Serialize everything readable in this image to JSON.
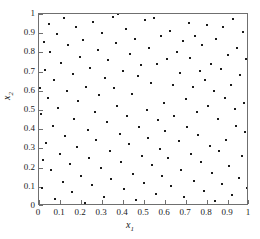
{
  "chart_data": {
    "type": "scatter",
    "title": "",
    "xlabel": "x1",
    "ylabel": "x2",
    "xlabel_base": "x",
    "xlabel_sub": "1",
    "ylabel_base": "x",
    "ylabel_sub": "2",
    "xlim": [
      0,
      1
    ],
    "ylim": [
      0,
      1
    ],
    "grid": false,
    "legend": null,
    "marker": "square-dot",
    "marker_color": "#1a1a1a",
    "marker_size_px": 2,
    "xticks": [
      0,
      0.1,
      0.2,
      0.3,
      0.4,
      0.5,
      0.6,
      0.7,
      0.8,
      0.9,
      1
    ],
    "yticks": [
      0,
      0.1,
      0.2,
      0.3,
      0.4,
      0.5,
      0.6,
      0.7,
      0.8,
      0.9,
      1
    ],
    "xticklabels": [
      "0",
      "0.1",
      "0.2",
      "0.3",
      "0.4",
      "0.5",
      "0.6",
      "0.7",
      "0.8",
      "0.9",
      "1"
    ],
    "yticklabels": [
      "0",
      "0.1",
      "0.2",
      "0.3",
      "0.4",
      "0.5",
      "0.6",
      "0.7",
      "0.8",
      "0.9",
      "1"
    ],
    "tick_direction": "in",
    "n_points": 150,
    "points": [
      [
        0.005,
        0.617
      ],
      [
        0.008,
        0.478
      ],
      [
        0.012,
        0.095
      ],
      [
        0.018,
        0.238
      ],
      [
        0.022,
        0.855
      ],
      [
        0.03,
        0.71
      ],
      [
        0.035,
        0.328
      ],
      [
        0.042,
        0.562
      ],
      [
        0.048,
        0.948
      ],
      [
        0.052,
        0.802
      ],
      [
        0.058,
        0.186
      ],
      [
        0.065,
        0.418
      ],
      [
        0.072,
        0.655
      ],
      [
        0.078,
        0.036
      ],
      [
        0.085,
        0.895
      ],
      [
        0.092,
        0.51
      ],
      [
        0.098,
        0.272
      ],
      [
        0.105,
        0.745
      ],
      [
        0.112,
        0.124
      ],
      [
        0.118,
        0.978
      ],
      [
        0.125,
        0.362
      ],
      [
        0.132,
        0.598
      ],
      [
        0.14,
        0.838
      ],
      [
        0.148,
        0.218
      ],
      [
        0.155,
        0.071
      ],
      [
        0.162,
        0.69
      ],
      [
        0.168,
        0.455
      ],
      [
        0.175,
        0.93
      ],
      [
        0.182,
        0.305
      ],
      [
        0.188,
        0.545
      ],
      [
        0.195,
        0.778
      ],
      [
        0.202,
        0.158
      ],
      [
        0.21,
        0.865
      ],
      [
        0.218,
        0.018
      ],
      [
        0.225,
        0.622
      ],
      [
        0.232,
        0.398
      ],
      [
        0.238,
        0.252
      ],
      [
        0.245,
        0.718
      ],
      [
        0.252,
        0.108
      ],
      [
        0.258,
        0.958
      ],
      [
        0.265,
        0.488
      ],
      [
        0.272,
        0.342
      ],
      [
        0.28,
        0.812
      ],
      [
        0.288,
        0.578
      ],
      [
        0.295,
        0.2
      ],
      [
        0.302,
        0.902
      ],
      [
        0.308,
        0.048
      ],
      [
        0.315,
        0.665
      ],
      [
        0.322,
        0.435
      ],
      [
        0.33,
        0.758
      ],
      [
        0.338,
        0.288
      ],
      [
        0.345,
        0.14
      ],
      [
        0.352,
        0.985
      ],
      [
        0.358,
        0.612
      ],
      [
        0.365,
        0.848
      ],
      [
        0.372,
        0.522
      ],
      [
        0.378,
        0.998
      ],
      [
        0.385,
        0.375
      ],
      [
        0.392,
        0.228
      ],
      [
        0.398,
        0.705
      ],
      [
        0.405,
        0.088
      ],
      [
        0.412,
        0.922
      ],
      [
        0.42,
        0.47
      ],
      [
        0.428,
        0.322
      ],
      [
        0.435,
        0.79
      ],
      [
        0.442,
        0.585
      ],
      [
        0.448,
        0.168
      ],
      [
        0.455,
        0.868
      ],
      [
        0.462,
        0.032
      ],
      [
        0.47,
        0.675
      ],
      [
        0.478,
        0.412
      ],
      [
        0.485,
        0.735
      ],
      [
        0.492,
        0.262
      ],
      [
        0.498,
        0.12
      ],
      [
        0.505,
        0.968
      ],
      [
        0.512,
        0.5
      ],
      [
        0.518,
        0.355
      ],
      [
        0.525,
        0.822
      ],
      [
        0.532,
        0.642
      ],
      [
        0.54,
        0.212
      ],
      [
        0.548,
        0.978
      ],
      [
        0.555,
        0.065
      ],
      [
        0.562,
        0.738
      ],
      [
        0.568,
        0.448
      ],
      [
        0.575,
        0.298
      ],
      [
        0.582,
        0.885
      ],
      [
        0.588,
        0.155
      ],
      [
        0.595,
        0.535
      ],
      [
        0.602,
        0.392
      ],
      [
        0.608,
        0.768
      ],
      [
        0.615,
        0.248
      ],
      [
        0.622,
        0.912
      ],
      [
        0.63,
        0.102
      ],
      [
        0.638,
        0.628
      ],
      [
        0.645,
        0.468
      ],
      [
        0.652,
        0.005
      ],
      [
        0.658,
        0.802
      ],
      [
        0.665,
        0.338
      ],
      [
        0.672,
        0.695
      ],
      [
        0.678,
        0.188
      ],
      [
        0.685,
        0.858
      ],
      [
        0.692,
        0.045
      ],
      [
        0.698,
        0.555
      ],
      [
        0.705,
        0.412
      ],
      [
        0.712,
        0.955
      ],
      [
        0.718,
        0.772
      ],
      [
        0.725,
        0.272
      ],
      [
        0.732,
        0.622
      ],
      [
        0.738,
        0.132
      ],
      [
        0.745,
        0.888
      ],
      [
        0.752,
        0.488
      ],
      [
        0.758,
        0.368
      ],
      [
        0.765,
        0.705
      ],
      [
        0.772,
        0.228
      ],
      [
        0.778,
        0.838
      ],
      [
        0.785,
        0.078
      ],
      [
        0.792,
        0.658
      ],
      [
        0.798,
        0.942
      ],
      [
        0.805,
        0.522
      ],
      [
        0.812,
        0.312
      ],
      [
        0.818,
        0.742
      ],
      [
        0.825,
        0.172
      ],
      [
        0.832,
        0.598
      ],
      [
        0.838,
        0.025
      ],
      [
        0.845,
        0.868
      ],
      [
        0.852,
        0.452
      ],
      [
        0.858,
        0.285
      ],
      [
        0.865,
        0.712
      ],
      [
        0.872,
        0.115
      ],
      [
        0.878,
        0.932
      ],
      [
        0.885,
        0.562
      ],
      [
        0.892,
        0.345
      ],
      [
        0.898,
        0.785
      ],
      [
        0.905,
        0.208
      ],
      [
        0.912,
        0.632
      ],
      [
        0.918,
        0.058
      ],
      [
        0.925,
        0.972
      ],
      [
        0.932,
        0.505
      ],
      [
        0.938,
        0.418
      ],
      [
        0.945,
        0.825
      ],
      [
        0.952,
        0.148
      ],
      [
        0.958,
        0.682
      ],
      [
        0.965,
        0.258
      ],
      [
        0.972,
        0.905
      ],
      [
        0.978,
        0.535
      ],
      [
        0.982,
        0.385
      ],
      [
        0.988,
        0.768
      ],
      [
        0.992,
        0.092
      ],
      [
        0.995,
        0.648
      ],
      [
        0.998,
        0.385
      ]
    ]
  }
}
